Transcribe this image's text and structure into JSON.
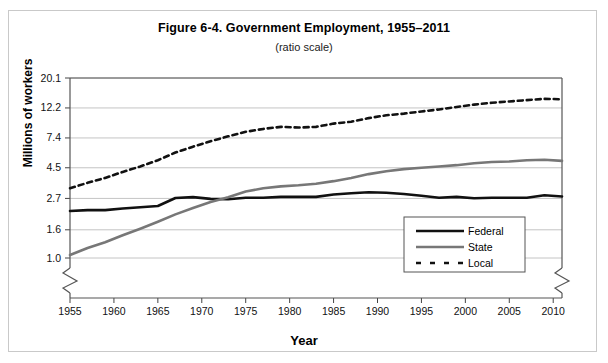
{
  "figure": {
    "title": "Figure 6-4. Government Employment, 1955–2011",
    "subtitle": "(ratio scale)"
  },
  "chart_data": {
    "type": "line",
    "title": "Figure 6-4. Government Employment, 1955–2011",
    "subtitle": "(ratio scale)",
    "xlabel": "Year",
    "ylabel": "Millions of workers",
    "scale": "log",
    "grid": true,
    "legend_position": "bottom-right",
    "xlim": [
      1955,
      2011
    ],
    "ylim": [
      1.0,
      20.1
    ],
    "xticks": [
      1955,
      1960,
      1965,
      1970,
      1975,
      1980,
      1985,
      1990,
      1995,
      2000,
      2005,
      2010
    ],
    "yticks": [
      1.0,
      1.6,
      2.7,
      4.5,
      7.4,
      12.2,
      20.1
    ],
    "ytick_labels": [
      "1.0",
      "1.6",
      "2.7",
      "4.5",
      "7.4",
      "12.2",
      "20.1"
    ],
    "axis_break_x": true,
    "axis_break_y": true,
    "x": [
      1955,
      1957,
      1959,
      1961,
      1963,
      1965,
      1967,
      1969,
      1971,
      1973,
      1975,
      1977,
      1979,
      1981,
      1983,
      1985,
      1987,
      1989,
      1991,
      1993,
      1995,
      1997,
      1999,
      2001,
      2003,
      2005,
      2007,
      2009,
      2011
    ],
    "series": [
      {
        "name": "Federal",
        "color": "#111111",
        "style": "solid",
        "width": 2.6,
        "values": [
          2.19,
          2.22,
          2.22,
          2.28,
          2.33,
          2.38,
          2.72,
          2.76,
          2.68,
          2.66,
          2.73,
          2.73,
          2.77,
          2.77,
          2.77,
          2.88,
          2.94,
          2.99,
          2.97,
          2.91,
          2.82,
          2.73,
          2.77,
          2.71,
          2.73,
          2.73,
          2.73,
          2.85,
          2.79
        ]
      },
      {
        "name": "State",
        "color": "#777777",
        "style": "solid",
        "width": 2.6,
        "values": [
          1.05,
          1.18,
          1.3,
          1.46,
          1.63,
          1.83,
          2.07,
          2.3,
          2.54,
          2.75,
          3.03,
          3.2,
          3.3,
          3.36,
          3.45,
          3.6,
          3.8,
          4.05,
          4.25,
          4.4,
          4.5,
          4.6,
          4.7,
          4.85,
          4.95,
          5.0,
          5.1,
          5.15,
          5.05
        ]
      },
      {
        "name": "Local",
        "color": "#111111",
        "style": "dashed",
        "width": 2.6,
        "values": [
          3.2,
          3.5,
          3.8,
          4.2,
          4.6,
          5.1,
          5.8,
          6.4,
          7.0,
          7.6,
          8.2,
          8.6,
          8.9,
          8.8,
          8.9,
          9.4,
          9.7,
          10.3,
          10.8,
          11.1,
          11.5,
          11.9,
          12.4,
          12.9,
          13.3,
          13.6,
          13.9,
          14.2,
          14.1
        ]
      }
    ]
  },
  "legend": {
    "items": [
      {
        "label": "Federal"
      },
      {
        "label": "State"
      },
      {
        "label": "Local"
      }
    ]
  }
}
